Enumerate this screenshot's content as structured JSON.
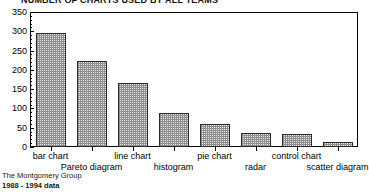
{
  "chart_data": {
    "type": "bar",
    "title": "NUMBER OF CHARTS USED BY ALL TEAMS",
    "xlabel": "",
    "ylabel": "",
    "ylim": [
      0,
      350
    ],
    "ytick_step": 50,
    "yminor_step": 10,
    "grid": false,
    "legend": null,
    "categories": [
      "bar chart",
      "Pareto diagram",
      "line chart",
      "histogram",
      "pie chart",
      "radar",
      "control chart",
      "scatter diagram"
    ],
    "values": [
      295,
      222,
      165,
      87,
      60,
      36,
      35,
      12
    ],
    "ytick_labels": [
      "350",
      "300",
      "250",
      "200",
      "150",
      "100",
      "50",
      "0"
    ],
    "ytick_values": [
      350,
      300,
      250,
      200,
      150,
      100,
      50,
      0
    ]
  },
  "footer": {
    "source": "The Montgomery Group",
    "period": "1988 - 1994 data"
  }
}
